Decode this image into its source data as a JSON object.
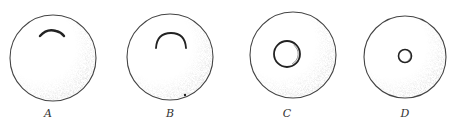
{
  "figure": {
    "colors": {
      "outline": "#444444",
      "feature": "#222222",
      "stipple": "#9a9a9a",
      "background": "#ffffff"
    },
    "panels": [
      {
        "label": "A",
        "cx": 53,
        "cy": 58,
        "r": 43,
        "feature": "shallow arc near top",
        "feature_path": "M 40 36 Q 47 28 56 31 Q 61 32 64 36",
        "stroke_width": 2.4,
        "label_x": 48,
        "label_y": 117
      },
      {
        "label": "B",
        "cx": 170,
        "cy": 57,
        "r": 43,
        "feature": "horseshoe arc near top",
        "feature_path": "M 156 48 Q 157 33 171 33 Q 185 33 186 48",
        "stroke_width": 1.8,
        "dot": {
          "cx": 185,
          "cy": 95,
          "r": 1.2
        },
        "label_x": 170,
        "label_y": 117
      },
      {
        "label": "C",
        "cx": 293,
        "cy": 55,
        "r": 43,
        "feature": "central ring",
        "ring": {
          "cx": 287,
          "cy": 54,
          "r": 13,
          "stroke_width": 1.8
        },
        "label_x": 287,
        "label_y": 117
      },
      {
        "label": "D",
        "cx": 405,
        "cy": 57,
        "r": 41,
        "feature": "small central ring",
        "ring": {
          "cx": 405,
          "cy": 56,
          "r": 6.5,
          "stroke_width": 1.6
        },
        "label_x": 405,
        "label_y": 117
      }
    ]
  }
}
